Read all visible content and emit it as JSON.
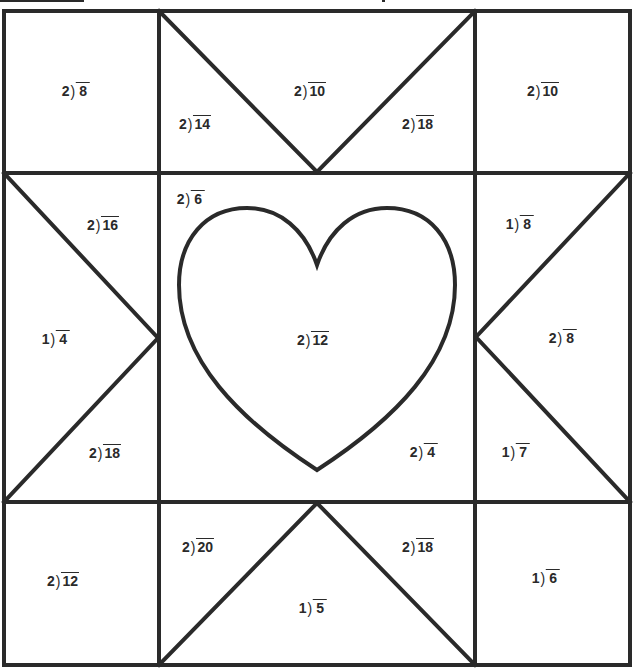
{
  "worksheet": {
    "type": "division quilt coloring worksheet",
    "line_color": "#2a2a2a",
    "background": "#ffffff",
    "cells": [
      {
        "id": "top-left-square",
        "divisor": "2",
        "dividend": "8",
        "x": 76,
        "y": 90
      },
      {
        "id": "top-middle-left-triangle",
        "divisor": "2",
        "dividend": "14",
        "x": 195,
        "y": 123
      },
      {
        "id": "top-middle-top-triangle",
        "divisor": "2",
        "dividend": "10",
        "x": 310,
        "y": 90
      },
      {
        "id": "top-middle-right-triangle",
        "divisor": "2",
        "dividend": "18",
        "x": 418,
        "y": 123
      },
      {
        "id": "top-right-square",
        "divisor": "2",
        "dividend": "10",
        "x": 543,
        "y": 90
      },
      {
        "id": "middle-left-top-triangle",
        "divisor": "2",
        "dividend": "16",
        "x": 103,
        "y": 224
      },
      {
        "id": "middle-left-left-triangle",
        "divisor": "1",
        "dividend": "4",
        "x": 56,
        "y": 338
      },
      {
        "id": "middle-left-bottom-triangle",
        "divisor": "2",
        "dividend": "18",
        "x": 105,
        "y": 452
      },
      {
        "id": "center-corner-top-left",
        "divisor": "2",
        "dividend": "6",
        "x": 191,
        "y": 198
      },
      {
        "id": "center-heart",
        "divisor": "2",
        "dividend": "12",
        "x": 313,
        "y": 339
      },
      {
        "id": "center-corner-bottom-right",
        "divisor": "2",
        "dividend": "4",
        "x": 424,
        "y": 451
      },
      {
        "id": "middle-right-top-triangle",
        "divisor": "1",
        "dividend": "8",
        "x": 520,
        "y": 223
      },
      {
        "id": "middle-right-right-triangle",
        "divisor": "2",
        "dividend": "8",
        "x": 563,
        "y": 337
      },
      {
        "id": "middle-right-bottom-triangle",
        "divisor": "1",
        "dividend": "7",
        "x": 516,
        "y": 451
      },
      {
        "id": "bottom-left-square",
        "divisor": "2",
        "dividend": "12",
        "x": 63,
        "y": 580
      },
      {
        "id": "bottom-middle-left-triangle",
        "divisor": "2",
        "dividend": "20",
        "x": 198,
        "y": 546
      },
      {
        "id": "bottom-middle-bottom-triangle",
        "divisor": "1",
        "dividend": "5",
        "x": 313,
        "y": 607
      },
      {
        "id": "bottom-middle-right-triangle",
        "divisor": "2",
        "dividend": "18",
        "x": 418,
        "y": 546
      },
      {
        "id": "bottom-right-square",
        "divisor": "1",
        "dividend": "6",
        "x": 546,
        "y": 577
      }
    ]
  }
}
